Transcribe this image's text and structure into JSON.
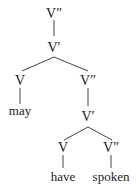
{
  "tree": {
    "nodes": {
      "root": "V″",
      "vbar1": "V′",
      "v_left": "V",
      "may": "may",
      "vdp_right": "V″",
      "vbar2": "V′",
      "v_have": "V",
      "have": "have",
      "vdp_spoken": "V″",
      "spoken": "spoken"
    },
    "structure": "[V″ [V′ [V may] [V″ [V′ [V have] [V″ spoken]]]]]"
  },
  "colors": {
    "text": "#222222",
    "lines": "#444444",
    "background": "#ffffff"
  }
}
